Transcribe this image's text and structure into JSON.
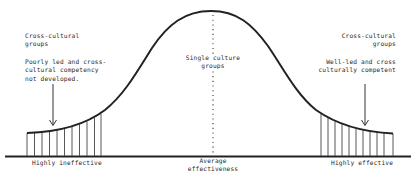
{
  "diagram": {
    "type": "bell-curve",
    "colors": {
      "line": "#222222",
      "hatch": "#444444",
      "text": "#2a2a2a",
      "background": "#ffffff"
    },
    "left_annotation": {
      "title": [
        "Cross-cultural",
        "groups"
      ],
      "description": [
        "Poorly led and cross-",
        "cultural competency",
        "not developed."
      ]
    },
    "right_annotation": {
      "title": [
        "Cross-cultural",
        "groups"
      ],
      "description": [
        "Well-led and cross",
        "culturally competent"
      ]
    },
    "center_annotation": [
      "Single culture",
      "groups"
    ],
    "axis_labels": {
      "left": "Highly ineffective",
      "center": [
        "Average",
        "effectiveness"
      ],
      "right": "Highly effective"
    }
  }
}
